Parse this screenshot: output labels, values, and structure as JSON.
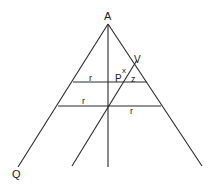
{
  "diagram": {
    "labels": {
      "apex": "A",
      "bottom_left": "Q",
      "point_v": "V",
      "point_p": "P",
      "angle_x": "x",
      "segment_z": "z",
      "upper_left_r": "r",
      "lower_left_r": "r",
      "lower_right_r": "r"
    },
    "colors": {
      "line": "#2a2a2a",
      "text": "#222222",
      "background": "#ffffff"
    }
  }
}
